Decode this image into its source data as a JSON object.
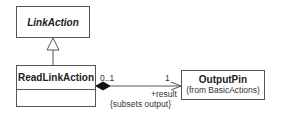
{
  "diagram": {
    "type": "uml-class",
    "classes": {
      "link_action": {
        "name": "LinkAction",
        "abstract": true
      },
      "read_link_action": {
        "name": "ReadLinkAction"
      },
      "output_pin": {
        "name": "OutputPin",
        "package_note": "(from BasicActions)"
      }
    },
    "generalization": {
      "from": "ReadLinkAction",
      "to": "LinkAction"
    },
    "association": {
      "source": "ReadLinkAction",
      "target": "OutputPin",
      "aggregation": "composite",
      "source_multiplicity": "0..1",
      "target_multiplicity": "1",
      "target_role": "+result",
      "constraint": "{subsets output}"
    }
  }
}
